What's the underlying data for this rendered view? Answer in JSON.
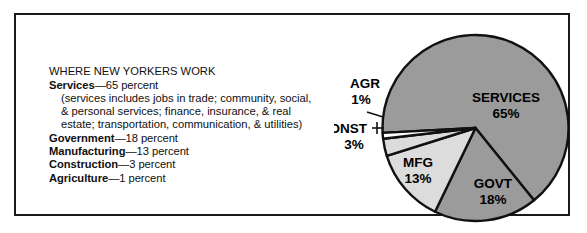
{
  "figure": {
    "title": "WHERE NEW YORKERS WORK"
  },
  "legend": {
    "title": "WHERE NEW YORKERS WORK",
    "items": [
      {
        "label": "Services",
        "dash": "—65 percent"
      },
      {
        "label": "Government",
        "dash": "—18 percent"
      },
      {
        "label": "Manufacturing",
        "dash": "—13 percent"
      },
      {
        "label": "Construction",
        "dash": "—3 percent"
      },
      {
        "label": "Agriculture",
        "dash": "—1 percent"
      }
    ],
    "note_lines": [
      "(services includes jobs in trade; community, social,",
      "& personal services; finance, insurance, & real",
      "estate; transportation, communication, & utilities)"
    ]
  },
  "chart_data": {
    "type": "pie",
    "title": "WHERE NEW YORKERS WORK",
    "categories": [
      "SERVICES",
      "GOVT",
      "MFG",
      "CONST",
      "AGR"
    ],
    "values": [
      65,
      18,
      13,
      3,
      1
    ],
    "unit": "percent",
    "labels": [
      "SERVICES\n65%",
      "GOVT\n18%",
      "MFG\n13%",
      "CONST\n3%",
      "AGR\n1%"
    ],
    "slices": [
      {
        "name": "SERVICES",
        "value": 65,
        "value_label": "65%",
        "color": "#9b9b9b",
        "label_placement": "inside"
      },
      {
        "name": "GOVT",
        "value": 18,
        "value_label": "18%",
        "color": "#9b9b9b",
        "label_placement": "inside"
      },
      {
        "name": "MFG",
        "value": 13,
        "value_label": "13%",
        "color": "#dcdcdc",
        "label_placement": "inside"
      },
      {
        "name": "CONST",
        "value": 3,
        "value_label": "3%",
        "color": "#dcdcdc",
        "label_placement": "outside-left"
      },
      {
        "name": "AGR",
        "value": 1,
        "value_label": "1%",
        "color": "#ffffff",
        "label_placement": "outside-left"
      }
    ],
    "legend_position": "left",
    "grid": false,
    "colors": {
      "dark_gray": "#9b9b9b",
      "light_gray": "#dcdcdc",
      "outline": "#111111",
      "background": "#ffffff"
    }
  },
  "pie_text": {
    "services_name": "SERVICES",
    "services_pct": "65%",
    "govt_name": "GOVT",
    "govt_pct": "18%",
    "mfg_name": "MFG",
    "mfg_pct": "13%",
    "const_name": "CONST",
    "const_pct": "3%",
    "agr_name": "AGR",
    "agr_pct": "1%"
  }
}
